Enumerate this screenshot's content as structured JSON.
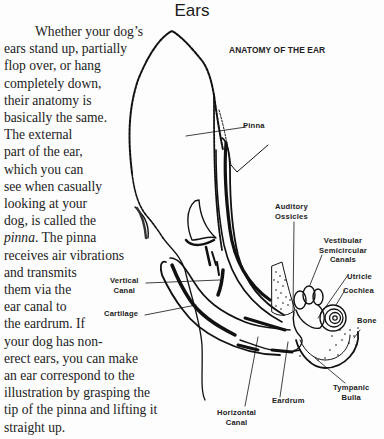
{
  "page": {
    "title": "Ears"
  },
  "body_text": {
    "lines": [
      "Whether your dog’s",
      "ears stand up, partially",
      "flop over, or hang",
      "completely down,",
      "their anatomy is",
      "basically the same.",
      "The external",
      "part of the ear,",
      "which you can",
      "see when casually",
      "looking at your",
      "dog, is called the",
      "The pinna",
      "receives air vibrations",
      "and transmits",
      "them via the",
      "ear canal to",
      "the eardrum. If",
      "your dog has non-",
      "erect ears, you can make",
      "an ear correspond to the",
      "illustration by grasping the",
      "tip of the pinna and lifting it",
      "straight up."
    ],
    "italic_term": "pinna",
    "italic_term_suffix": "."
  },
  "diagram": {
    "title": "ANATOMY OF THE EAR",
    "labels": {
      "pinna": "Pinna",
      "auditory_ossicles": [
        "Auditory",
        "Ossicles"
      ],
      "vestibular": [
        "Vestibular",
        "Semicircular",
        "Canals"
      ],
      "utricle": "Utricle",
      "cochlea": "Cochlea",
      "bone": "Bone",
      "vertical_canal": [
        "Vertical",
        "Canal"
      ],
      "cartilage": "Cartilage",
      "eardrum": "Eardrum",
      "tympanic_bulla": [
        "Tympanic",
        "Bulla"
      ],
      "horizontal_canal": [
        "Horizontal",
        "Canal"
      ]
    }
  }
}
